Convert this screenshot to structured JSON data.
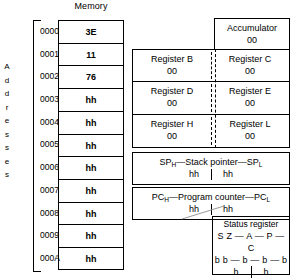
{
  "memory": {
    "title": "Memory",
    "addresses_label_letters": [
      "A",
      "d",
      "d",
      "r",
      "e",
      "s",
      "s",
      "e",
      "s"
    ],
    "addresses": [
      "0000",
      "0001",
      "0002",
      "0003",
      "0004",
      "0005",
      "0006",
      "0007",
      "0008",
      "0009",
      "000A"
    ],
    "values": [
      "3E",
      "11",
      "76",
      "hh",
      "hh",
      "hh",
      "hh",
      "hh",
      "hh",
      "hh",
      "hh"
    ]
  },
  "cpu": {
    "accumulator": {
      "label": "Accumulator",
      "value": "00"
    },
    "registers": [
      {
        "left_label": "Register B",
        "left_value": "00",
        "right_label": "Register C",
        "right_value": "00"
      },
      {
        "left_label": "Register D",
        "left_value": "00",
        "right_label": "Register E",
        "right_value": "00"
      },
      {
        "left_label": "Register H",
        "left_value": "00",
        "right_label": "Register L",
        "right_value": "00"
      }
    ],
    "stack_pointer": {
      "prefix": "SP",
      "prefix_sub": "H",
      "title": "—Stack pointer—",
      "suffix": "SP",
      "suffix_sub": "L",
      "high_value": "hh",
      "low_value": "hh"
    },
    "program_counter": {
      "prefix": "PC",
      "prefix_sub": "H",
      "title": "—Program counter—",
      "suffix": "PC",
      "suffix_sub": "L",
      "high_value": "hh",
      "low_value": "hh"
    },
    "status_register": {
      "title": "Status register",
      "flags": "S Z — A — P — C",
      "bits": "b b — b — b — b",
      "hex_left": "h",
      "hex_right": "h"
    }
  },
  "colors": {
    "ink": "#000000",
    "paper": "#ffffff",
    "connector": "#999999"
  }
}
